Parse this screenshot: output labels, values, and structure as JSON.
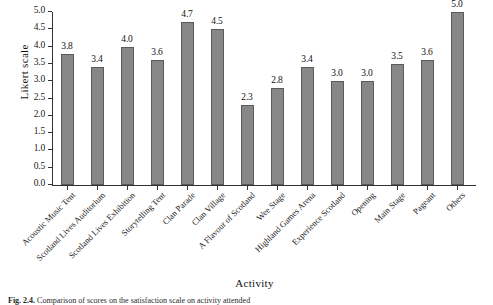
{
  "figure": {
    "caption_label": "Fig. 2.4.",
    "caption_text": "Comparison of scores on the satisfaction scale on activity attended"
  },
  "chart_data": {
    "type": "bar",
    "title": "",
    "xlabel": "Activity",
    "ylabel": "Likert scale",
    "ylim": [
      0,
      5
    ],
    "ytick_labels": [
      "0.0",
      "0.5",
      "1.0",
      "1.5",
      "2.0",
      "2.5",
      "3.0",
      "3.5",
      "4.0",
      "4.5",
      "5.0"
    ],
    "ytick_values": [
      0,
      0.5,
      1,
      1.5,
      2,
      2.5,
      3,
      3.5,
      4,
      4.5,
      5
    ],
    "grid": false,
    "legend": false,
    "bar_color": "#878787",
    "bar_edge_color": "#5b5b5b",
    "categories": [
      "Acoustic Music Tent",
      "Scotland Lives Auditorium",
      "Scotland Lives Exhibition",
      "Storytelling Tent",
      "Clan Parade",
      "Clan Village",
      "A Flavour of Scotland",
      "Wee Stage",
      "Highland Games Arena",
      "Experience Scotland",
      "Opening",
      "Main Stage",
      "Pageant",
      "Others"
    ],
    "values": [
      3.8,
      3.4,
      4.0,
      3.6,
      4.7,
      4.5,
      2.3,
      2.8,
      3.4,
      3.0,
      3.0,
      3.5,
      3.6,
      5.0
    ],
    "value_labels": [
      "3.8",
      "3.4",
      "4.0",
      "3.6",
      "4.7",
      "4.5",
      "2.3",
      "2.8",
      "3.4",
      "3.0",
      "3.0",
      "3.5",
      "3.6",
      "5.0"
    ]
  }
}
